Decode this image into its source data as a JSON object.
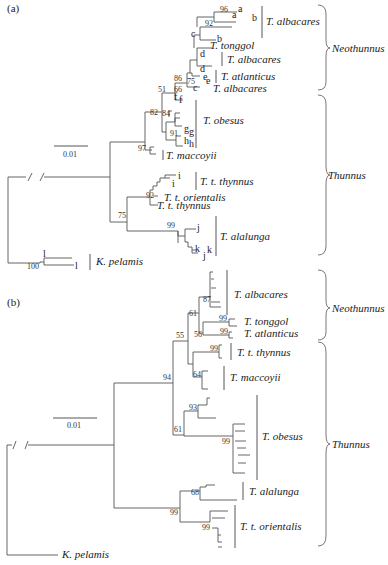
{
  "figure": {
    "panel_a": {
      "label": "(a)",
      "scale_bar": "0.01",
      "bootstrap": [
        "96",
        "92",
        "86",
        "75",
        "66",
        "51",
        "82",
        "84",
        "91",
        "97",
        "92",
        "75",
        "99",
        "100"
      ],
      "tip_letters": [
        "a",
        "a",
        "b",
        "b",
        "c",
        "c",
        "d",
        "d",
        "e",
        "e",
        "f",
        "f",
        "g",
        "g",
        "h",
        "h",
        "i",
        "i",
        "j",
        "j",
        "k",
        "k",
        "l",
        "l"
      ],
      "species": {
        "albacares_1": "T. albacares",
        "tonggol": "T. tonggol",
        "albacares_2": "T. albacares",
        "atlanticus": "T. atlanticus",
        "albacares_3": "T. albacares",
        "obesus": "T. obesus",
        "maccoyii": "T. maccoyii",
        "thynnus_1": "T. t. thynnus",
        "orientalis": "T. t. orientalis",
        "thynnus_2": "T. t. thynnus",
        "alalunga": "T. alalunga",
        "pelamis": "K. pelamis"
      },
      "clades": {
        "neothunnus": "Neothunnus",
        "thunnus": "Thunnus"
      }
    },
    "panel_b": {
      "label": "(b)",
      "scale_bar": "0.01",
      "bootstrap": [
        "87",
        "61",
        "99",
        "56",
        "99",
        "55",
        "99",
        "64",
        "94",
        "93",
        "61",
        "99",
        "68",
        "99",
        "99"
      ],
      "species": {
        "albacares": "T. albacares",
        "tonggol": "T. tonggol",
        "atlanticus": "T. atlanticus",
        "thynnus": "T. t. thynnus",
        "maccoyii": "T. maccoyii",
        "obesus": "T. obesus",
        "alalunga": "T. alalunga",
        "orientalis": "T. t. orientalis",
        "pelamis": "K. pelamis"
      },
      "clades": {
        "neothunnus": "Neothunnus",
        "thunnus": "Thunnus"
      }
    }
  }
}
